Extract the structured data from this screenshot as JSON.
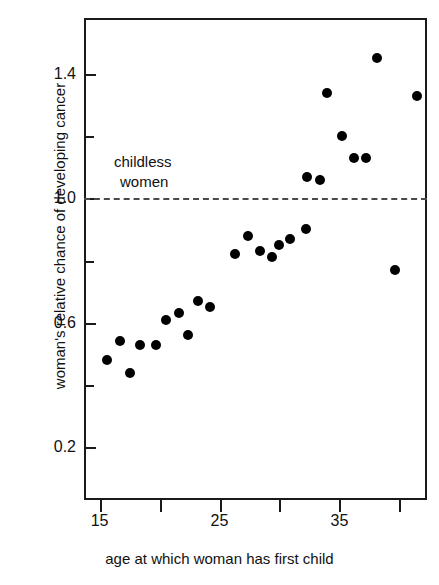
{
  "chart_data": {
    "type": "scatter",
    "title": "",
    "xlabel": "age at which woman has first child",
    "ylabel": "woman's relative chance of developing cancer",
    "xlim": [
      13.7,
      42.3
    ],
    "ylim": [
      0.03,
      1.58
    ],
    "grid": false,
    "legend": null,
    "x_ticks_major": [
      15,
      25,
      35
    ],
    "x_tick_labels": [
      "15",
      "25",
      "35"
    ],
    "x_ticks_minor": [
      20,
      30,
      40
    ],
    "y_ticks_major": [
      0.2,
      0.6,
      1.0,
      1.4
    ],
    "y_tick_labels": [
      "0.2",
      "0.6",
      "1.0",
      "1.4"
    ],
    "y_ticks_minor": [
      0.4,
      0.8,
      1.2
    ],
    "reference_line": {
      "y": 1.0,
      "style": "dashed",
      "label_line1": "childless",
      "label_line2": "women",
      "color": "#4a4a4a"
    },
    "point_color": "#000000",
    "points": [
      {
        "x": 15.6,
        "y": 0.48
      },
      {
        "x": 16.7,
        "y": 0.54
      },
      {
        "x": 17.5,
        "y": 0.44
      },
      {
        "x": 18.4,
        "y": 0.53
      },
      {
        "x": 19.7,
        "y": 0.53
      },
      {
        "x": 20.5,
        "y": 0.61
      },
      {
        "x": 21.6,
        "y": 0.63
      },
      {
        "x": 22.4,
        "y": 0.56
      },
      {
        "x": 23.2,
        "y": 0.67
      },
      {
        "x": 24.2,
        "y": 0.65
      },
      {
        "x": 26.3,
        "y": 0.82
      },
      {
        "x": 27.4,
        "y": 0.88
      },
      {
        "x": 28.4,
        "y": 0.83
      },
      {
        "x": 29.4,
        "y": 0.81
      },
      {
        "x": 30.0,
        "y": 0.85
      },
      {
        "x": 30.9,
        "y": 0.87
      },
      {
        "x": 32.2,
        "y": 0.9
      },
      {
        "x": 32.3,
        "y": 1.07
      },
      {
        "x": 33.4,
        "y": 1.06
      },
      {
        "x": 34.0,
        "y": 1.34
      },
      {
        "x": 35.2,
        "y": 1.2
      },
      {
        "x": 36.2,
        "y": 1.13
      },
      {
        "x": 37.2,
        "y": 1.13
      },
      {
        "x": 38.1,
        "y": 1.45
      },
      {
        "x": 39.6,
        "y": 0.77
      },
      {
        "x": 41.5,
        "y": 1.33
      }
    ]
  },
  "axes": {
    "y_label_text": "woman's relative chance of developing cancer",
    "x_label_text": "age at which woman has first child"
  }
}
